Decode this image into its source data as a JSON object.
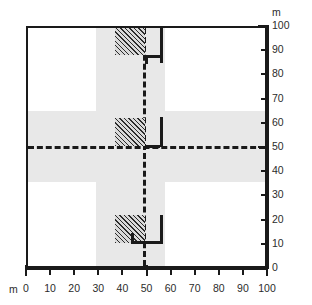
{
  "figure": {
    "background_color": "#ffffff",
    "line_color": "#1a1a1a",
    "corridor_color": "#e8e8e8",
    "hatch_color": "#2b2b2b"
  },
  "axes": {
    "unit_top_label": "m",
    "unit_bottom_label": "m",
    "y_axis_position": "right",
    "x_axis_position": "bottom",
    "y_ticks": [
      {
        "value": 100,
        "label": "100",
        "major": true
      },
      {
        "value": 90,
        "label": "90",
        "major": false
      },
      {
        "value": 80,
        "label": "80",
        "major": false
      },
      {
        "value": 70,
        "label": "70",
        "major": false
      },
      {
        "value": 60,
        "label": "60",
        "major": false
      },
      {
        "value": 50,
        "label": "50",
        "major": true
      },
      {
        "value": 40,
        "label": "40",
        "major": false
      },
      {
        "value": 30,
        "label": "30",
        "major": false
      },
      {
        "value": 20,
        "label": "20",
        "major": false
      },
      {
        "value": 10,
        "label": "10",
        "major": false
      },
      {
        "value": 0,
        "label": "0",
        "major": true
      }
    ],
    "x_ticks": [
      {
        "value": 0,
        "label": "0",
        "major": true
      },
      {
        "value": 10,
        "label": "10",
        "major": false
      },
      {
        "value": 20,
        "label": "20",
        "major": false
      },
      {
        "value": 30,
        "label": "30",
        "major": false
      },
      {
        "value": 40,
        "label": "40",
        "major": false
      },
      {
        "value": 50,
        "label": "50",
        "major": true
      },
      {
        "value": 60,
        "label": "60",
        "major": false
      },
      {
        "value": 70,
        "label": "70",
        "major": false
      },
      {
        "value": 80,
        "label": "80",
        "major": false
      },
      {
        "value": 90,
        "label": "90",
        "major": false
      },
      {
        "value": 100,
        "label": "100",
        "major": true
      }
    ],
    "xlim": [
      0,
      100
    ],
    "ylim": [
      0,
      100
    ]
  },
  "chart_data": {
    "type": "diagram",
    "title": "",
    "xlabel": "m",
    "ylabel": "m",
    "xlim": [
      0,
      100
    ],
    "ylim": [
      0,
      100
    ],
    "grid": false,
    "corridors": [
      {
        "name": "vertical-corridor",
        "x_from": 34,
        "x_to": 62,
        "y_from": 0,
        "y_to": 100,
        "color": "#e8e8e8"
      },
      {
        "name": "horizontal-corridor",
        "x_from": 0,
        "x_to": 100,
        "y_from": 35,
        "y_to": 64.5,
        "color": "#e8e8e8"
      }
    ],
    "centerlines": [
      {
        "name": "vertical-centerline",
        "orientation": "vertical",
        "position": 48,
        "style": "dashed"
      },
      {
        "name": "horizontal-centerline",
        "orientation": "horizontal",
        "position": 50,
        "style": "dashed"
      }
    ],
    "blocks": [
      {
        "name": "block-top",
        "x_from": 44,
        "x_to": 57,
        "y_from": 88.5,
        "y_to": 100,
        "fill": "hatched"
      },
      {
        "name": "block-middle",
        "x_from": 44,
        "x_to": 57,
        "y_from": 50.4,
        "y_to": 62.2,
        "fill": "hatched"
      },
      {
        "name": "block-bottom",
        "x_from": 44,
        "x_to": 57,
        "y_from": 9.6,
        "y_to": 21.4,
        "fill": "hatched"
      }
    ],
    "walls": [
      {
        "name": "wall-top",
        "points": [
          [
            48,
            85.6
          ],
          [
            48,
            88.6
          ],
          [
            57,
            88.6
          ],
          [
            57,
            100
          ]
        ]
      },
      {
        "name": "wall-middle",
        "points": [
          [
            48,
            50
          ],
          [
            57,
            50
          ],
          [
            57,
            62.4
          ]
        ]
      },
      {
        "name": "wall-bottom",
        "points": [
          [
            48,
            9.9
          ],
          [
            48,
            14
          ],
          [
            57,
            10.4
          ],
          [
            57,
            21.6
          ]
        ]
      }
    ]
  }
}
